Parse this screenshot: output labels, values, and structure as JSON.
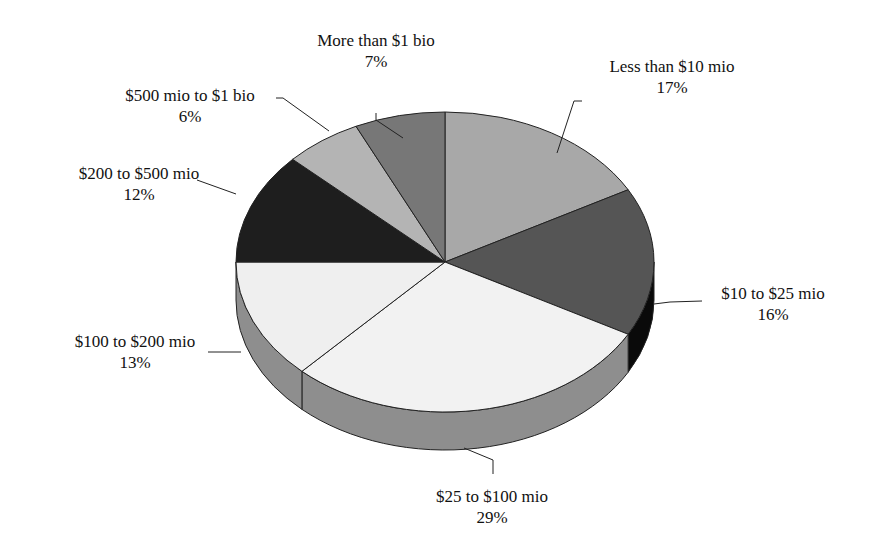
{
  "chart_data": {
    "type": "pie",
    "style": "3d",
    "title": "",
    "categories": [
      "Less than $10 mio",
      "$10 to $25 mio",
      "$25 to $100 mio",
      "$100 to $200 mio",
      "$200 to $500 mio",
      "$500 mio to $1 bio",
      "More than $1 bio"
    ],
    "values": [
      17,
      16,
      29,
      13,
      12,
      6,
      7
    ],
    "value_labels": [
      "17%",
      "16%",
      "29%",
      "13%",
      "12%",
      "6%",
      "7%"
    ],
    "colors": [
      "#a8a8a8",
      "#555555",
      "#f2f2f2",
      "#efefef",
      "#1e1e1e",
      "#b4b4b4",
      "#777777"
    ],
    "side_colors": [
      "#8a8a8a",
      "#0a0a0a",
      "#8e8e8e",
      "#8e8e8e",
      "#111111",
      "#999999",
      "#5a5a5a"
    ],
    "start_angle_deg": -90,
    "direction": "clockwise",
    "legend": "none, data labels with leader lines"
  },
  "labels": [
    {
      "name": "Less than $10 mio",
      "pct": "17%",
      "x": 672,
      "y": 56
    },
    {
      "name": "$10 to $25 mio",
      "pct": "16%",
      "x": 773,
      "y": 283
    },
    {
      "name": "$25 to $100 mio",
      "pct": "29%",
      "x": 492,
      "y": 486
    },
    {
      "name": "$100 to $200 mio",
      "pct": "13%",
      "x": 135,
      "y": 331
    },
    {
      "name": "$200 to $500 mio",
      "pct": "12%",
      "x": 139,
      "y": 163
    },
    {
      "name": "$500 mio to $1 bio",
      "pct": "6%",
      "x": 190,
      "y": 85
    },
    {
      "name": "More than $1 bio",
      "pct": "7%",
      "x": 376,
      "y": 30
    }
  ]
}
